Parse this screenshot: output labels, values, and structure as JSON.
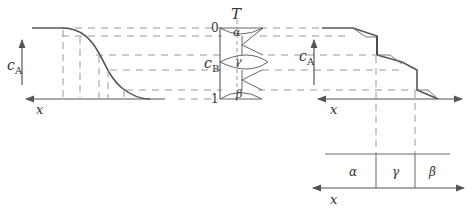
{
  "diagram": {
    "title": "",
    "left_plot": {
      "y_label": "c",
      "y_label_sub": "A",
      "x_label": "x"
    },
    "phase_diagram": {
      "temperature_label": "T",
      "top_value": "0",
      "bottom_value": "1",
      "composition_label": "c",
      "composition_label_sub": "B",
      "phases": [
        "α",
        "γ",
        "β"
      ]
    },
    "right_plot": {
      "y_label": "c",
      "y_label_sub": "A",
      "x_label": "x"
    },
    "phase_strip": {
      "regions": [
        "α",
        "γ",
        "β"
      ],
      "x_label": "x"
    }
  }
}
